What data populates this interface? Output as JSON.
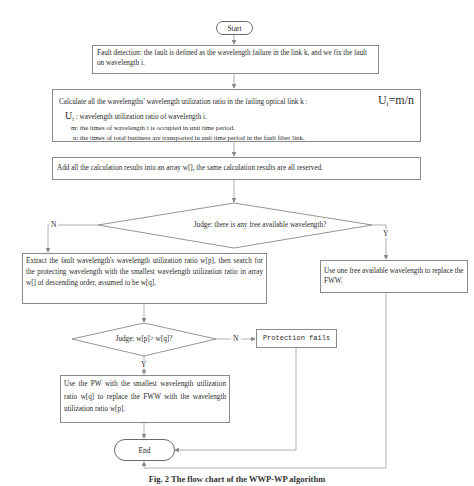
{
  "diagram": {
    "type": "flowchart",
    "nodes": {
      "start": {
        "label": "Start"
      },
      "fault_detection": {
        "label": "Fault detection: the fault is defined as the wavelength failure in the link k, and we fix the fault on wavelength i."
      },
      "calculate": {
        "label": "Calculate all the wavelengths' wavelength utilization ratio in the failing optical link k :",
        "formula": "Ui=m/n",
        "formula_symbol": "U",
        "formula_sub": "i",
        "formula_rhs": "=m/n",
        "def_symbol": "U",
        "def_sub": "i",
        "def_ui": ": wavelength utilization ratio of wavelength i.",
        "def_m": "m: the times of wavelength i is occupied in unit time period.",
        "def_n": "n: the times of total business are transported in unit time period in the fault fiber link."
      },
      "add_results": {
        "label": "Add all the calculation results into an array w[], the same calculation results are all reserved."
      },
      "judge_free": {
        "label": "Judge: there is any  free available wavelength?"
      },
      "extract": {
        "label": "Extract the fault wavelength's wavelength utilization ratio w[p], then search for the protecting wavelength with the smallest wavelength utilization ratio in array w[]  of descending order, assumed to be w[q]."
      },
      "use_free": {
        "label": "Use one free available wavelength to replace the FWW."
      },
      "judge_compare": {
        "label": "Judge: w[p]> w[q]?"
      },
      "protection_fails": {
        "label": "Protection fails"
      },
      "use_pw": {
        "label": "Use  the PW with the smallest wavelength utilization ratio w[q]  to replace the FWW with the wavelength utilization ratio w[p]."
      },
      "end": {
        "label": "End"
      }
    },
    "edges": [
      {
        "from": "start",
        "to": "fault_detection",
        "label": ""
      },
      {
        "from": "fault_detection",
        "to": "calculate",
        "label": ""
      },
      {
        "from": "calculate",
        "to": "add_results",
        "label": ""
      },
      {
        "from": "add_results",
        "to": "judge_free",
        "label": ""
      },
      {
        "from": "judge_free",
        "to": "extract",
        "label": "N"
      },
      {
        "from": "judge_free",
        "to": "use_free",
        "label": "Y"
      },
      {
        "from": "extract",
        "to": "judge_compare",
        "label": ""
      },
      {
        "from": "judge_compare",
        "to": "protection_fails",
        "label": "N"
      },
      {
        "from": "judge_compare",
        "to": "use_pw",
        "label": "Y"
      },
      {
        "from": "use_pw",
        "to": "end",
        "label": ""
      },
      {
        "from": "protection_fails",
        "to": "end",
        "label": ""
      },
      {
        "from": "use_free",
        "to": "end",
        "label": ""
      }
    ],
    "edge_labels": {
      "no": "N",
      "yes": "Y"
    },
    "colors": {
      "line": "#9a9a9a",
      "border": "#8a8a8a",
      "text": "#2a2a2a"
    }
  },
  "caption": "Fig. 2   The flow chart of the WWP-WP algorithm"
}
